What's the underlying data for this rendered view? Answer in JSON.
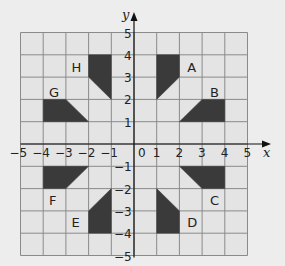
{
  "diagram": {
    "type": "coordinate-grid",
    "x_axis": {
      "label": "x",
      "min": -5,
      "max": 5,
      "ticks": [
        "-5",
        "-4",
        "-3",
        "-2",
        "-1",
        "0",
        "1",
        "2",
        "3",
        "4",
        "5"
      ]
    },
    "y_axis": {
      "label": "y",
      "min": -5,
      "max": 5,
      "ticks": [
        "5",
        "4",
        "3",
        "2",
        "1",
        "-1",
        "-2",
        "-3",
        "-4",
        "-5"
      ]
    },
    "origin_label": "0",
    "colors": {
      "background": "#ededed",
      "grid_fill": "#e4e4e4",
      "grid_line": "#8a8a8a",
      "shape_fill": "#3a3a3a",
      "axis": "#111111"
    },
    "shapes": [
      {
        "label": "A",
        "points": [
          [
            1,
            4
          ],
          [
            2,
            4
          ],
          [
            2,
            3
          ],
          [
            1,
            2
          ]
        ],
        "label_pos": [
          2.35,
          3.45
        ]
      },
      {
        "label": "B",
        "points": [
          [
            4,
            2
          ],
          [
            4,
            1
          ],
          [
            2,
            1
          ],
          [
            3,
            2
          ]
        ],
        "label_pos": [
          3.35,
          2.35
        ]
      },
      {
        "label": "C",
        "points": [
          [
            4,
            -1
          ],
          [
            4,
            -2
          ],
          [
            3,
            -2
          ],
          [
            2,
            -1
          ]
        ],
        "label_pos": [
          3.35,
          -2.5
        ]
      },
      {
        "label": "D",
        "points": [
          [
            1,
            -2
          ],
          [
            2,
            -3
          ],
          [
            2,
            -4
          ],
          [
            1,
            -4
          ]
        ],
        "label_pos": [
          2.35,
          -3.5
        ]
      },
      {
        "label": "E",
        "points": [
          [
            -1,
            -2
          ],
          [
            -2,
            -3
          ],
          [
            -2,
            -4
          ],
          [
            -1,
            -4
          ]
        ],
        "label_pos": [
          -2.75,
          -3.5
        ]
      },
      {
        "label": "F",
        "points": [
          [
            -4,
            -1
          ],
          [
            -2,
            -1
          ],
          [
            -3,
            -2
          ],
          [
            -4,
            -2
          ]
        ],
        "label_pos": [
          -3.75,
          -2.5
        ]
      },
      {
        "label": "G",
        "points": [
          [
            -4,
            2
          ],
          [
            -3,
            2
          ],
          [
            -2,
            1
          ],
          [
            -4,
            1
          ]
        ],
        "label_pos": [
          -3.75,
          2.35
        ]
      },
      {
        "label": "H",
        "points": [
          [
            -2,
            4
          ],
          [
            -1,
            4
          ],
          [
            -1,
            2
          ],
          [
            -2,
            3
          ]
        ],
        "label_pos": [
          -2.75,
          3.45
        ]
      }
    ]
  }
}
